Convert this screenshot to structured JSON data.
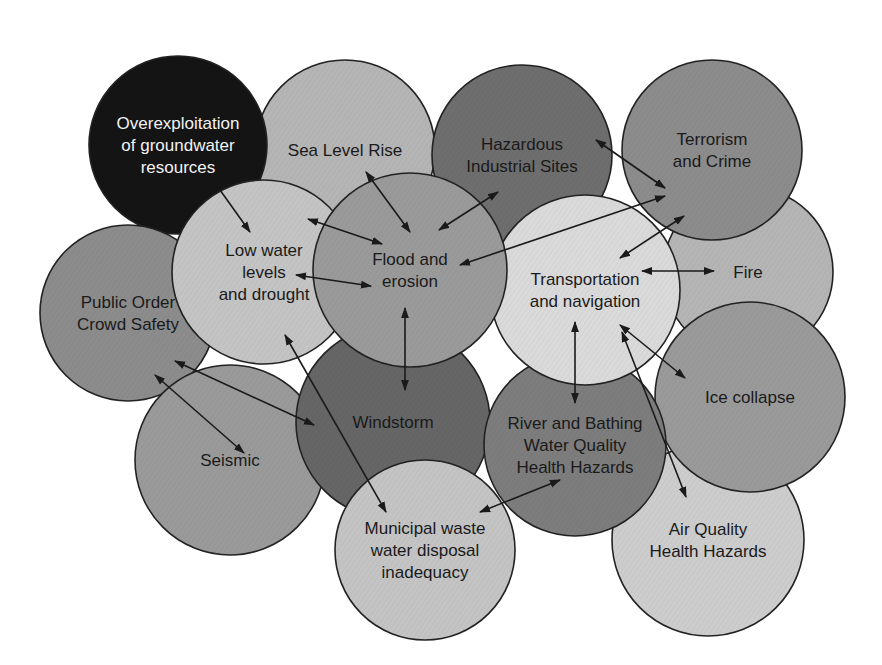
{
  "diagram": {
    "colors": {
      "black": "#141414",
      "dark": "#6e6e6e",
      "mid_dark": "#858585",
      "mid": "#9a9a9a",
      "light": "#bdbdbd",
      "very_light": "#d9d9d9",
      "stroke": "#222222",
      "arrow": "#1a1a1a"
    },
    "nodes": [
      {
        "id": "overexploitation",
        "lines": [
          "Overexploitation",
          "of groundwater",
          "resources"
        ],
        "cx": 178,
        "cy": 145,
        "r": 89,
        "fill": "#141414",
        "text_color": "light"
      },
      {
        "id": "sea-level-rise",
        "lines": [
          "Sea Level Rise"
        ],
        "cx": 345,
        "cy": 150,
        "r": 90,
        "fill": "#b5b5b5"
      },
      {
        "id": "hazardous-industrial-sites",
        "lines": [
          "Hazardous",
          "Industrial Sites"
        ],
        "cx": 522,
        "cy": 155,
        "r": 90,
        "fill": "#6e6e6e"
      },
      {
        "id": "terrorism-and-crime",
        "lines": [
          "Terrorism",
          "and Crime"
        ],
        "cx": 712,
        "cy": 150,
        "r": 90,
        "fill": "#8c8c8c"
      },
      {
        "id": "fire",
        "lines": [
          "Fire"
        ],
        "cx": 748,
        "cy": 272,
        "r": 85,
        "fill": "#b5b5b5"
      },
      {
        "id": "public-order",
        "lines": [
          "Public Order",
          "Crowd Safety"
        ],
        "cx": 128,
        "cy": 313,
        "r": 88,
        "fill": "#8c8c8c"
      },
      {
        "id": "low-water-levels",
        "lines": [
          "Low water",
          "levels",
          "and drought"
        ],
        "cx": 264,
        "cy": 272,
        "r": 92,
        "fill": "#c4c4c4"
      },
      {
        "id": "flood-and-erosion",
        "lines": [
          "Flood and",
          "erosion"
        ],
        "cx": 410,
        "cy": 270,
        "r": 97,
        "fill": "#9a9a9a"
      },
      {
        "id": "transportation-and-navigation",
        "lines": [
          "Transportation",
          "and navigation"
        ],
        "cx": 585,
        "cy": 290,
        "r": 95,
        "fill": "#dadada"
      },
      {
        "id": "windstorm",
        "lines": [
          "Windstorm"
        ],
        "cx": 393,
        "cy": 422,
        "r": 97,
        "fill": "#666666"
      },
      {
        "id": "seismic",
        "lines": [
          "Seismic"
        ],
        "cx": 230,
        "cy": 460,
        "r": 95,
        "fill": "#9a9a9a"
      },
      {
        "id": "river-and-bathing",
        "lines": [
          "River and Bathing",
          "Water Quality",
          "Health Hazards"
        ],
        "cx": 575,
        "cy": 445,
        "r": 91,
        "fill": "#7d7d7d"
      },
      {
        "id": "ice-collapse",
        "lines": [
          "Ice collapse"
        ],
        "cx": 750,
        "cy": 397,
        "r": 95,
        "fill": "#9a9a9a"
      },
      {
        "id": "municipal-waste-water",
        "lines": [
          "Municipal waste",
          "water disposal",
          "inadequacy"
        ],
        "cx": 425,
        "cy": 550,
        "r": 90,
        "fill": "#c4c4c4"
      },
      {
        "id": "air-quality",
        "lines": [
          "Air Quality",
          "Health Hazards"
        ],
        "cx": 708,
        "cy": 540,
        "r": 96,
        "fill": "#cdcdcd"
      }
    ],
    "draw_order": [
      "sea-level-rise",
      "hazardous-industrial-sites",
      "overexploitation",
      "fire",
      "terrorism-and-crime",
      "public-order",
      "seismic",
      "air-quality",
      "ice-collapse",
      "windstorm",
      "municipal-waste-water",
      "river-and-bathing",
      "transportation-and-navigation",
      "low-water-levels",
      "flood-and-erosion"
    ],
    "arrows": [
      {
        "from": [
          220,
          190
        ],
        "to": [
          250,
          232
        ],
        "heads": "end"
      },
      {
        "from": [
          366,
          172
        ],
        "to": [
          410,
          232
        ],
        "heads": "both"
      },
      {
        "from": [
          308,
          219
        ],
        "to": [
          382,
          244
        ],
        "heads": "both"
      },
      {
        "from": [
          296,
          275
        ],
        "to": [
          371,
          286
        ],
        "heads": "both"
      },
      {
        "from": [
          498,
          192
        ],
        "to": [
          439,
          230
        ],
        "heads": "both"
      },
      {
        "from": [
          596,
          140
        ],
        "to": [
          665,
          188
        ],
        "heads": "both"
      },
      {
        "from": [
          665,
          196
        ],
        "to": [
          460,
          265
        ],
        "heads": "both"
      },
      {
        "from": [
          684,
          216
        ],
        "to": [
          620,
          258
        ],
        "heads": "both"
      },
      {
        "from": [
          642,
          271
        ],
        "to": [
          714,
          271
        ],
        "heads": "both"
      },
      {
        "from": [
          405,
          308
        ],
        "to": [
          405,
          390
        ],
        "heads": "both"
      },
      {
        "from": [
          575,
          322
        ],
        "to": [
          575,
          403
        ],
        "heads": "both"
      },
      {
        "from": [
          620,
          325
        ],
        "to": [
          685,
          378
        ],
        "heads": "both"
      },
      {
        "from": [
          622,
          332
        ],
        "to": [
          686,
          497
        ],
        "heads": "both"
      },
      {
        "from": [
          285,
          335
        ],
        "to": [
          386,
          512
        ],
        "heads": "both"
      },
      {
        "from": [
          175,
          361
        ],
        "to": [
          314,
          425
        ],
        "heads": "both"
      },
      {
        "from": [
          155,
          375
        ],
        "to": [
          244,
          453
        ],
        "heads": "both"
      },
      {
        "from": [
          480,
          512
        ],
        "to": [
          560,
          480
        ],
        "heads": "both"
      }
    ]
  }
}
